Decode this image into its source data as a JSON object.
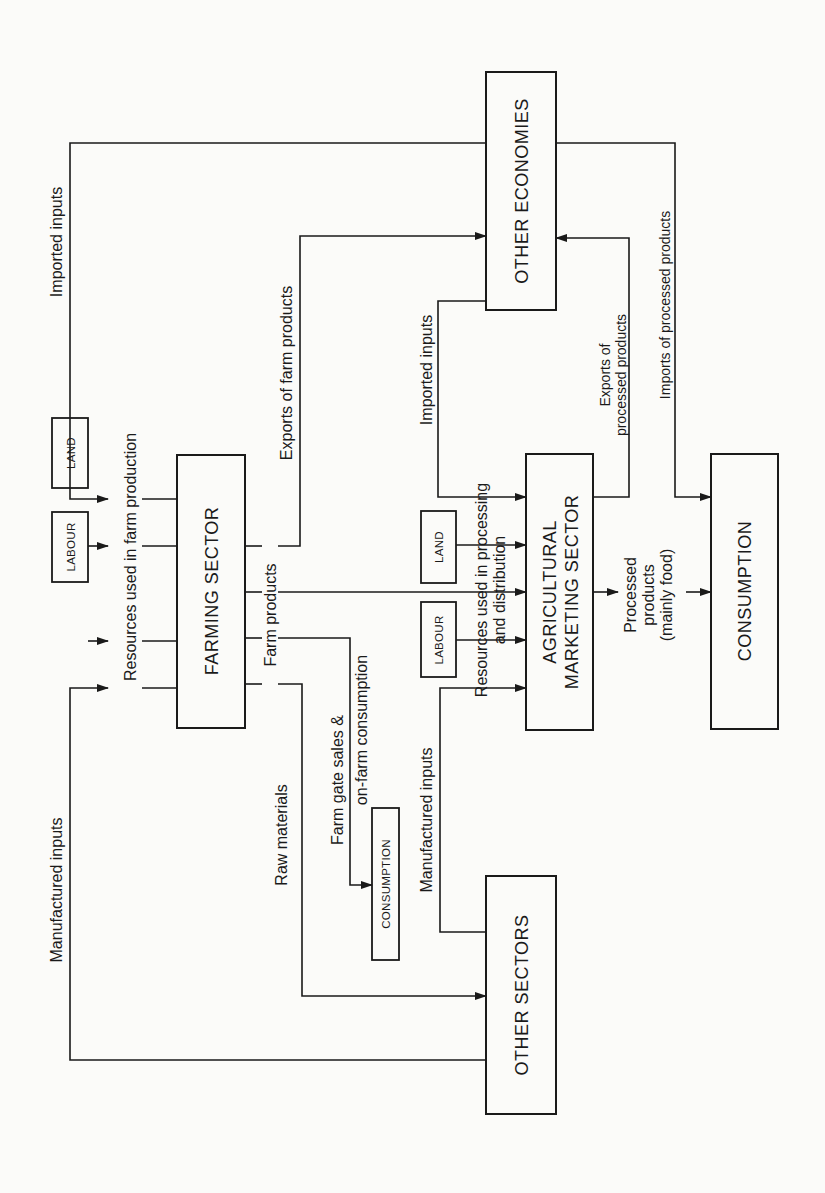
{
  "diagram": {
    "orientation": "rotated 90 degrees counter-clockwise",
    "nodes": {
      "farming_sector": "FARMING SECTOR",
      "agricultural_marketing_sector": {
        "line1": "AGRICULTURAL",
        "line2": "MARKETING SECTOR"
      },
      "other_economies": "OTHER ECONOMIES",
      "other_sectors": "OTHER SECTORS",
      "consumption": "CONSUMPTION",
      "farm_consumption": "CONSUMPTION",
      "labour_farm": "LABOUR",
      "land_farm": "LAND",
      "labour_marketing": "LABOUR",
      "land_marketing": "LAND"
    },
    "labels": {
      "imported_inputs_farm": "Imported inputs",
      "resources_farm": "Resources used in farm production",
      "manufactured_inputs_farm": "Manufactured inputs",
      "exports_farm_products": "Exports of farm products",
      "farm_products": "Farm products",
      "raw_materials": "Raw materials",
      "farm_gate_line1": "Farm gate sales &",
      "farm_gate_line2": "on-farm consumption",
      "manufactured_inputs_marketing": "Manufactured inputs",
      "resources_marketing_line1": "Resources used in processing",
      "resources_marketing_line2": "and distribution",
      "imported_inputs_marketing": "Imported inputs",
      "exports_processed_line1": "Exports of",
      "exports_processed_line2": "processed products",
      "imports_processed": "Imports of processed products",
      "processed_line1": "Processed",
      "processed_line2": "products",
      "processed_line3": "(mainly food)"
    },
    "edges": [
      {
        "from": "OTHER ECONOMIES",
        "to": "FARMING SECTOR",
        "label": "Imported inputs"
      },
      {
        "from": "OTHER SECTORS",
        "to": "FARMING SECTOR",
        "label": "Manufactured inputs"
      },
      {
        "from": "LABOUR",
        "to": "FARMING SECTOR"
      },
      {
        "from": "LAND",
        "to": "FARMING SECTOR"
      },
      {
        "from": "FARMING SECTOR",
        "to": "OTHER ECONOMIES",
        "label": "Exports of farm products"
      },
      {
        "from": "FARMING SECTOR",
        "to": "AGRICULTURAL MARKETING SECTOR",
        "label": "Farm products"
      },
      {
        "from": "FARMING SECTOR",
        "to": "CONSUMPTION (on-farm)",
        "label": "Farm gate sales & on-farm consumption"
      },
      {
        "from": "FARMING SECTOR",
        "to": "OTHER SECTORS",
        "label": "Raw materials"
      },
      {
        "from": "OTHER SECTORS",
        "to": "AGRICULTURAL MARKETING SECTOR",
        "label": "Manufactured inputs"
      },
      {
        "from": "LABOUR",
        "to": "AGRICULTURAL MARKETING SECTOR"
      },
      {
        "from": "LAND",
        "to": "AGRICULTURAL MARKETING SECTOR"
      },
      {
        "from": "OTHER ECONOMIES",
        "to": "AGRICULTURAL MARKETING SECTOR",
        "label": "Imported inputs"
      },
      {
        "from": "AGRICULTURAL MARKETING SECTOR",
        "to": "OTHER ECONOMIES",
        "label": "Exports of processed products"
      },
      {
        "from": "AGRICULTURAL MARKETING SECTOR",
        "to": "CONSUMPTION",
        "label": "Processed products (mainly food)"
      },
      {
        "from": "OTHER ECONOMIES",
        "to": "CONSUMPTION",
        "label": "Imports of processed products"
      }
    ]
  }
}
